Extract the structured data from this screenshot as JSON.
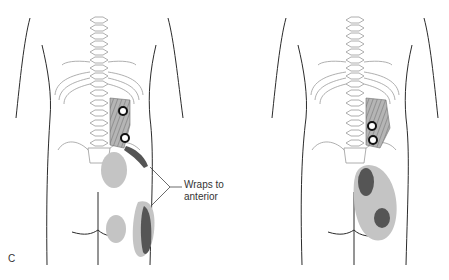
{
  "figure": {
    "panel_label": "C",
    "annotation": {
      "line1": "Wraps to",
      "line2": "anterior"
    },
    "views": [
      {
        "name": "left-back-view",
        "trigger_points": 2,
        "referral_zones": [
          "upper-buttock",
          "lower-buttock",
          "lateral-hip"
        ]
      },
      {
        "name": "right-back-view",
        "trigger_points": 3,
        "referral_zones": [
          "buttock-upper",
          "buttock-lower"
        ]
      }
    ],
    "colors": {
      "outline": "#2b2b2b",
      "spine": "#9a9a9a",
      "muscle": "#8f8f8f",
      "referral_light": "#c4c4c4",
      "referral_dark": "#555555",
      "trigger_point": "#111111"
    }
  }
}
